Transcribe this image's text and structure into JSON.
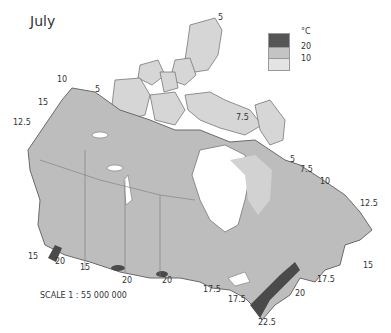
{
  "title": "July",
  "legend": {
    "unit": "°C",
    "items": [
      {
        "label": "20",
        "color": "#555555"
      },
      {
        "label": "10",
        "color": "#c4c4c4"
      },
      {
        "label": "",
        "color": "#e4e4e4"
      }
    ]
  },
  "scale": "SCALE 1 : 55 000 000",
  "colors": {
    "land_base": "#bdbdbd",
    "land_cool": "#dcdcdc",
    "land_warm": "#4a4a4a",
    "border": "#6a6a6a",
    "water": "#ffffff"
  },
  "isotherm_labels": [
    {
      "text": "5",
      "x": 218,
      "y": 18
    },
    {
      "text": "10",
      "x": 57,
      "y": 80
    },
    {
      "text": "5",
      "x": 95,
      "y": 90
    },
    {
      "text": "15",
      "x": 38,
      "y": 103
    },
    {
      "text": "12.5",
      "x": 13,
      "y": 123
    },
    {
      "text": "7.5",
      "x": 236,
      "y": 118
    },
    {
      "text": "5",
      "x": 290,
      "y": 160
    },
    {
      "text": "7.5",
      "x": 300,
      "y": 170
    },
    {
      "text": "10",
      "x": 320,
      "y": 182
    },
    {
      "text": "12.5",
      "x": 360,
      "y": 204
    },
    {
      "text": "15",
      "x": 363,
      "y": 266
    },
    {
      "text": "15",
      "x": 28,
      "y": 257
    },
    {
      "text": "20",
      "x": 55,
      "y": 262
    },
    {
      "text": "15",
      "x": 80,
      "y": 268
    },
    {
      "text": "20",
      "x": 122,
      "y": 281
    },
    {
      "text": "20",
      "x": 162,
      "y": 281
    },
    {
      "text": "17.5",
      "x": 203,
      "y": 290
    },
    {
      "text": "17.5",
      "x": 228,
      "y": 300
    },
    {
      "text": "20",
      "x": 295,
      "y": 294
    },
    {
      "text": "17.5",
      "x": 317,
      "y": 280
    },
    {
      "text": "22.5",
      "x": 258,
      "y": 323
    }
  ]
}
